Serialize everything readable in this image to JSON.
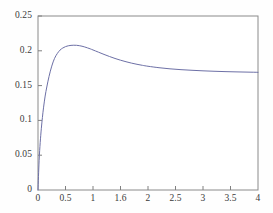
{
  "chart_data": {
    "type": "line",
    "title": "",
    "subtitle": "",
    "xlabel": "",
    "ylabel": "",
    "xlim": [
      0,
      4
    ],
    "ylim": [
      0,
      0.25
    ],
    "grid": false,
    "legend": null,
    "legend_position": "none",
    "annotations": [],
    "xticks": [
      0,
      0.5,
      1,
      1.6,
      2,
      2.5,
      3,
      3.5,
      4
    ],
    "xtick_labels": [
      "0",
      "0.5",
      "1",
      "1.6",
      "2",
      "2.5",
      "3",
      "3.5",
      "4"
    ],
    "yticks": [
      0,
      0.05,
      0.1,
      0.15,
      0.2,
      0.25
    ],
    "ytick_labels": [
      "0",
      "0.05",
      "0.1",
      "0.15",
      "0.2",
      "0.25"
    ],
    "series": [
      {
        "name": "curve",
        "color": "#6d70a6",
        "line_width": 1,
        "x": [
          0,
          0.02,
          0.04,
          0.06,
          0.08,
          0.1,
          0.13,
          0.16,
          0.2,
          0.25,
          0.3,
          0.35,
          0.4,
          0.45,
          0.5,
          0.55,
          0.6,
          0.65,
          0.7,
          0.75,
          0.8,
          0.85,
          0.9,
          0.95,
          1,
          1.1,
          1.2,
          1.3,
          1.4,
          1.5,
          1.6,
          1.7,
          1.8,
          1.9,
          2,
          2.2,
          2.4,
          2.6,
          2.8,
          3,
          3.2,
          3.4,
          3.6,
          3.8,
          4
        ],
        "y": [
          0,
          0.042,
          0.068,
          0.088,
          0.104,
          0.118,
          0.135,
          0.148,
          0.163,
          0.178,
          0.189,
          0.196,
          0.201,
          0.204,
          0.206,
          0.2072,
          0.2078,
          0.208,
          0.2079,
          0.2074,
          0.2066,
          0.2055,
          0.2042,
          0.2028,
          0.2012,
          0.198,
          0.1948,
          0.1918,
          0.189,
          0.1865,
          0.1843,
          0.1823,
          0.1806,
          0.1791,
          0.1778,
          0.1757,
          0.1741,
          0.1729,
          0.172,
          0.1712,
          0.1706,
          0.1701,
          0.1697,
          0.1694,
          0.1691
        ],
        "peak": {
          "x": 0.7,
          "y": 0.208
        },
        "asymptote": 0.168,
        "start": {
          "x": 0,
          "y": 0
        }
      }
    ],
    "axis_color": "#808080",
    "tick_color": "#808080",
    "label_color": "#3a3a3a",
    "background_color": "#fefefe"
  },
  "geometry": {
    "plot_left": 38,
    "plot_right": 258,
    "plot_top": 16,
    "plot_bottom": 190
  }
}
